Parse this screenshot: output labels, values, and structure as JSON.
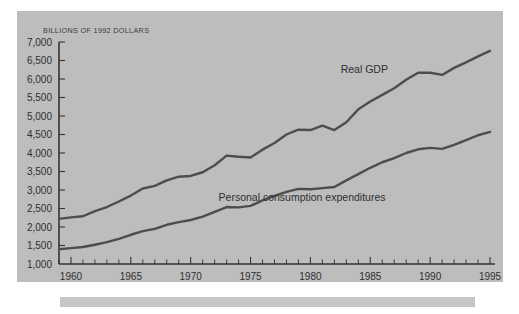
{
  "figure": {
    "background_color": "#ffffff",
    "panel_color": "#bdbdbd",
    "caption_bar_color": "#c6c6c6",
    "line_color": "#4d4d4d",
    "axis_color": "#343434",
    "text_color": "#2e2e2e"
  },
  "chart_data": {
    "type": "line",
    "title": "",
    "subtitle": "",
    "xlabel": "",
    "ylabel": "BILLIONS OF 1992 DOLLARS",
    "xlim": [
      1959,
      1995
    ],
    "ylim": [
      1000,
      7000
    ],
    "grid": false,
    "legend_position": "inline-annotations",
    "y_ticks": [
      1000,
      1500,
      2000,
      2500,
      3000,
      3500,
      4000,
      4500,
      5000,
      5500,
      6000,
      6500,
      7000
    ],
    "y_tick_labels": [
      "1,000",
      "1,500",
      "2,000",
      "2,500",
      "3,000",
      "3,500",
      "4,000",
      "4,500",
      "5,000",
      "5,500",
      "6,000",
      "6,500",
      "7,000"
    ],
    "x_ticks": [
      1960,
      1965,
      1970,
      1975,
      1980,
      1985,
      1990,
      1995
    ],
    "x_tick_labels": [
      "1960",
      "1965",
      "1970",
      "1975",
      "1980",
      "1985",
      "1990",
      "1995"
    ],
    "x_minor_tick_interval": 1,
    "x": [
      1959,
      1960,
      1961,
      1962,
      1963,
      1964,
      1965,
      1966,
      1967,
      1968,
      1969,
      1970,
      1971,
      1972,
      1973,
      1974,
      1975,
      1976,
      1977,
      1978,
      1979,
      1980,
      1981,
      1982,
      1983,
      1984,
      1985,
      1986,
      1987,
      1988,
      1989,
      1990,
      1991,
      1992,
      1993,
      1994,
      1995
    ],
    "series": [
      {
        "name": "Real GDP",
        "label": "Real GDP",
        "label_x": 1984.5,
        "label_y": 6150,
        "values": [
          2220,
          2260,
          2290,
          2430,
          2540,
          2690,
          2850,
          3040,
          3110,
          3260,
          3360,
          3380,
          3480,
          3670,
          3930,
          3900,
          3880,
          4090,
          4270,
          4500,
          4630,
          4620,
          4740,
          4620,
          4830,
          5180,
          5390,
          5570,
          5750,
          5980,
          6170,
          6170,
          6110,
          6300,
          6450,
          6610,
          6760
        ]
      },
      {
        "name": "Personal consumption expenditures",
        "label": "Personal consumption expenditures",
        "label_x": 1979.3,
        "label_y": 2700,
        "values": [
          1400,
          1430,
          1460,
          1520,
          1590,
          1680,
          1790,
          1890,
          1950,
          2060,
          2130,
          2190,
          2280,
          2410,
          2540,
          2530,
          2570,
          2720,
          2840,
          2950,
          3030,
          3020,
          3050,
          3080,
          3260,
          3430,
          3600,
          3750,
          3860,
          4000,
          4100,
          4140,
          4110,
          4220,
          4350,
          4480,
          4570
        ]
      }
    ]
  }
}
